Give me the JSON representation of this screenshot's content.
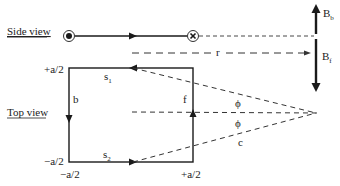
{
  "diagram": {
    "side_view": {
      "label": "Side view",
      "current_out_symbol": "circle-dot",
      "current_in_symbol": "circle-cross",
      "distance_label": "r"
    },
    "top_view": {
      "label": "Top view",
      "segments": {
        "top": "s",
        "top_sub": "1",
        "bottom": "s",
        "bottom_sub": "2",
        "left": "b",
        "right": "f"
      },
      "corner_labels": {
        "left_top": "+a/2",
        "left_bottom": "−a/2",
        "bottom_left": "−a/2",
        "bottom_right": "+a/2"
      },
      "angle_upper": "ϕ",
      "angle_lower": "ϕ",
      "hypotenuse_label": "c"
    },
    "field": {
      "back_label": "B",
      "back_sub": "b",
      "front_label": "B",
      "front_sub": "f"
    },
    "colors": {
      "line": "#1a1a1a",
      "dashed": "#333333"
    }
  }
}
